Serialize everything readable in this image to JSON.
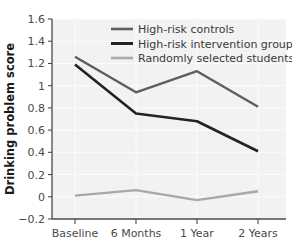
{
  "chart_data": {
    "type": "line",
    "title": "",
    "subtitle": "",
    "xlabel": "",
    "ylabel": "Drinking problem score",
    "categories": [
      "Baseline",
      "6 Months",
      "1 Year",
      "2 Years"
    ],
    "ylim": [
      -0.2,
      1.6
    ],
    "ytick_labels": [
      "1.6",
      "1.4",
      "1.2",
      "1",
      "0.8",
      "0.6",
      "0.4",
      "0.2",
      "0",
      "−0.2"
    ],
    "ytick_values": [
      1.6,
      1.4,
      1.2,
      1.0,
      0.8,
      0.6,
      0.4,
      0.2,
      0.0,
      -0.2
    ],
    "grid": true,
    "legend_position": "top-right-inside",
    "series": [
      {
        "name": "High-risk controls",
        "color": "#5e5e5e",
        "values": [
          1.26,
          0.94,
          1.13,
          0.81
        ]
      },
      {
        "name": "High-risk intervention group",
        "color": "#232323",
        "values": [
          1.19,
          0.75,
          0.68,
          0.41
        ]
      },
      {
        "name": "Randomly selected students",
        "color": "#a8a8a8",
        "values": [
          0.01,
          0.06,
          -0.03,
          0.05
        ]
      }
    ]
  },
  "legend": {
    "items": [
      {
        "label": "High-risk controls"
      },
      {
        "label": "High-risk intervention group"
      },
      {
        "label": "Randomly selected students"
      }
    ]
  },
  "axes": {
    "y_title": "Drinking problem score"
  },
  "colors": {
    "plot_background": "#f2f2f2",
    "axis": "#4a4a4a",
    "gridline": "#fbfbfb",
    "tick_text": "#4a4a4a",
    "title_text": "#1a1a1a"
  }
}
